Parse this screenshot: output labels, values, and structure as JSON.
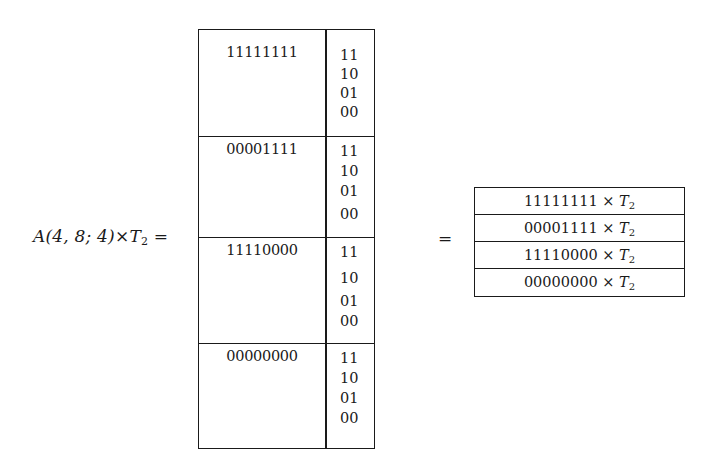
{
  "lhs": {
    "label_prefix": "A(4, 8; 4)×",
    "label_var": "T",
    "label_sub": "2",
    "equals": "="
  },
  "left_table": {
    "blocks": [
      {
        "pattern": "11111111",
        "codes": [
          "11",
          "10",
          "01",
          "00"
        ]
      },
      {
        "pattern": "00001111",
        "codes": [
          "11",
          "10",
          "01",
          "00"
        ]
      },
      {
        "pattern": "11110000",
        "codes": [
          "11",
          "10",
          "01",
          "00"
        ]
      },
      {
        "pattern": "00000000",
        "codes": [
          "11",
          "10",
          "01",
          "00"
        ]
      }
    ]
  },
  "middle": {
    "equals": "="
  },
  "right_table": {
    "operator": "×",
    "var": "T",
    "sub": "2",
    "rows": [
      {
        "pattern": "11111111"
      },
      {
        "pattern": "00001111"
      },
      {
        "pattern": "11110000"
      },
      {
        "pattern": "00000000"
      }
    ]
  }
}
